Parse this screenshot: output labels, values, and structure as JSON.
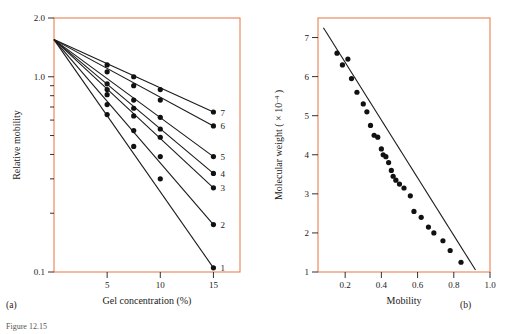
{
  "figure": {
    "caption": "Figure 12.15",
    "panel_a_letter": "(a)",
    "panel_b_letter": "(b)"
  },
  "chart_data": [
    {
      "type": "line",
      "panel": "a",
      "title": "",
      "xlabel": "Gel concentration (%)",
      "ylabel": "Relative mobility",
      "yscale": "log",
      "xlim": [
        0,
        17.5
      ],
      "ylim": [
        0.1,
        2.0
      ],
      "xticks": [
        5,
        10,
        15
      ],
      "xtick_labels": [
        "5",
        "10",
        "15"
      ],
      "yticks": [
        0.1,
        0.2,
        0.3,
        0.4,
        0.5,
        0.6,
        0.7,
        0.8,
        0.9,
        1.0,
        2.0
      ],
      "ytick_labels": [
        "0.1",
        "",
        "",
        "",
        "",
        "",
        "",
        "",
        "",
        "1.0",
        "2.0"
      ],
      "grid": false,
      "legend_position": "right-inline",
      "series": [
        {
          "name": "7",
          "label": "7",
          "x": [
            0,
            15
          ],
          "y": [
            1.55,
            0.66
          ],
          "points_x": [
            5,
            7.5,
            10,
            15
          ],
          "points_y": [
            1.15,
            1.0,
            0.86,
            0.66
          ]
        },
        {
          "name": "6",
          "label": "6",
          "x": [
            0,
            15
          ],
          "y": [
            1.55,
            0.56
          ],
          "points_x": [
            5,
            7.5,
            10,
            15
          ],
          "points_y": [
            1.06,
            0.9,
            0.76,
            0.56
          ]
        },
        {
          "name": "5",
          "label": "5",
          "x": [
            0,
            15
          ],
          "y": [
            1.55,
            0.39
          ],
          "points_x": [
            5,
            7.5,
            10,
            15
          ],
          "points_y": [
            0.92,
            0.76,
            0.62,
            0.39
          ]
        },
        {
          "name": "4",
          "label": "4",
          "x": [
            0,
            15
          ],
          "y": [
            1.55,
            0.32
          ],
          "points_x": [
            5,
            7.5,
            10,
            15
          ],
          "points_y": [
            0.86,
            0.69,
            0.54,
            0.32
          ]
        },
        {
          "name": "3",
          "label": "3",
          "x": [
            0,
            15
          ],
          "y": [
            1.55,
            0.27
          ],
          "points_x": [
            5,
            7.5,
            10,
            15
          ],
          "points_y": [
            0.81,
            0.63,
            0.49,
            0.27
          ]
        },
        {
          "name": "2",
          "label": "2",
          "x": [
            0,
            15
          ],
          "y": [
            1.55,
            0.175
          ],
          "points_x": [
            5,
            7.5,
            10,
            15
          ],
          "points_y": [
            0.72,
            0.53,
            0.39,
            0.175
          ]
        },
        {
          "name": "1",
          "label": "1",
          "x": [
            0,
            15
          ],
          "y": [
            1.55,
            0.105
          ],
          "points_x": [
            5,
            7.5,
            10,
            15
          ],
          "points_y": [
            0.64,
            0.44,
            0.3,
            0.105
          ]
        }
      ]
    },
    {
      "type": "scatter",
      "panel": "b",
      "title": "",
      "xlabel": "Mobility",
      "ylabel": "Molecular weight ( x 10 -4 )",
      "ylabel_main": "Molecular weight ( × 10",
      "ylabel_exp": "–4",
      "ylabel_tail": " )",
      "xlim": [
        0.05,
        1.0
      ],
      "ylim": [
        1,
        7.5
      ],
      "xticks": [
        0.2,
        0.4,
        0.6,
        0.8,
        1.0
      ],
      "xtick_labels": [
        "0.2",
        "0.4",
        "0.6",
        "0.8",
        "1.0"
      ],
      "yticks": [
        1,
        2,
        3,
        4,
        5,
        6,
        7
      ],
      "ytick_labels": [
        "1",
        "2",
        "3",
        "4",
        "5",
        "6",
        "7"
      ],
      "grid": false,
      "fit_line": {
        "x": [
          0.08,
          0.92
        ],
        "y": [
          7.25,
          1.05
        ]
      },
      "points": [
        {
          "x": 0.155,
          "y": 6.6
        },
        {
          "x": 0.185,
          "y": 6.3
        },
        {
          "x": 0.215,
          "y": 6.45
        },
        {
          "x": 0.235,
          "y": 5.95
        },
        {
          "x": 0.265,
          "y": 5.6
        },
        {
          "x": 0.3,
          "y": 5.3
        },
        {
          "x": 0.32,
          "y": 5.1
        },
        {
          "x": 0.34,
          "y": 4.75
        },
        {
          "x": 0.36,
          "y": 4.5
        },
        {
          "x": 0.38,
          "y": 4.45
        },
        {
          "x": 0.4,
          "y": 4.15
        },
        {
          "x": 0.41,
          "y": 4.0
        },
        {
          "x": 0.425,
          "y": 3.95
        },
        {
          "x": 0.44,
          "y": 3.8
        },
        {
          "x": 0.455,
          "y": 3.6
        },
        {
          "x": 0.465,
          "y": 3.45
        },
        {
          "x": 0.48,
          "y": 3.35
        },
        {
          "x": 0.5,
          "y": 3.25
        },
        {
          "x": 0.525,
          "y": 3.15
        },
        {
          "x": 0.56,
          "y": 2.95
        },
        {
          "x": 0.58,
          "y": 2.55
        },
        {
          "x": 0.62,
          "y": 2.4
        },
        {
          "x": 0.66,
          "y": 2.15
        },
        {
          "x": 0.69,
          "y": 2.0
        },
        {
          "x": 0.74,
          "y": 1.8
        },
        {
          "x": 0.78,
          "y": 1.55
        },
        {
          "x": 0.84,
          "y": 1.25
        }
      ]
    }
  ]
}
